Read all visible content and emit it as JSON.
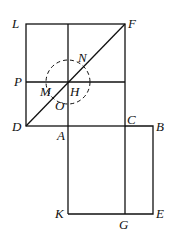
{
  "diagram": {
    "points": {
      "L": "L",
      "F": "F",
      "P": "P",
      "M": "M",
      "N": "N",
      "H": "H",
      "O": "O",
      "D": "D",
      "A": "A",
      "C": "C",
      "B": "B",
      "K": "K",
      "G": "G",
      "E": "E"
    }
  }
}
